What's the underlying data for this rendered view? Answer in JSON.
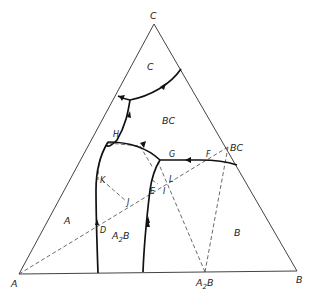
{
  "diagram": {
    "type": "ternary phase diagram",
    "vertices": {
      "A": "A",
      "B": "B",
      "C": "C"
    },
    "compound_labels": {
      "A2B_base": "A",
      "A2B_base_sub": "2",
      "A2B_base_tail": "B",
      "BC_edge": "BC"
    },
    "region_labels": {
      "C": "C",
      "BC": "BC",
      "A": "A",
      "B": "B",
      "A2B": "A",
      "A2B_sub": "2",
      "A2B_tail": "B"
    },
    "point_labels": {
      "H": "H",
      "G": "G",
      "F": "F",
      "K": "K",
      "L": "L",
      "E": "E",
      "I": "I",
      "J": "J",
      "D": "D"
    },
    "colors": {
      "line": "#111111",
      "edge": "#444444",
      "background": "#ffffff"
    }
  }
}
